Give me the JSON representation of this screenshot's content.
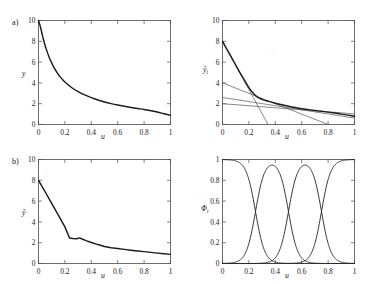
{
  "figure": {
    "background": "#ffffff",
    "line_color": "#1c1c1c",
    "thin_line_color": "#5a5a5a",
    "axis_color": "#4a4a4a"
  },
  "panels": {
    "a_label": "a)",
    "b_label": "b)"
  },
  "axes": {
    "x_label": "u",
    "x_ticks": [
      "0",
      "0.2",
      "0.4",
      "0.6",
      "0.8",
      "1"
    ],
    "x_tick_values": [
      0,
      0.2,
      0.4,
      0.6,
      0.8,
      1
    ],
    "y_label_a": "y",
    "y_label_a_right": "ŷ",
    "y_label_a_right_sub": "i",
    "y_label_b": "ŷ",
    "y_label_b_right": "Φ",
    "y_label_b_right_sub": "i",
    "y_ticks_value": [
      "0",
      "2",
      "4",
      "6",
      "8",
      "10"
    ],
    "y_tick_values_value": [
      0,
      2,
      4,
      6,
      8,
      10
    ],
    "y_ticks_unit": [
      "0",
      "0.2",
      "0.4",
      "0.6",
      "0.8",
      "1"
    ],
    "y_tick_values_unit": [
      0,
      0.2,
      0.4,
      0.6,
      0.8,
      1
    ]
  },
  "chart_data": [
    {
      "id": "panel-a-left",
      "type": "line",
      "title": "",
      "xlabel": "u",
      "ylabel": "y",
      "xlim": [
        0,
        1
      ],
      "ylim": [
        0,
        10
      ],
      "grid": false,
      "legend": "none",
      "series": [
        {
          "name": "true nonlinear system",
          "x": [
            0.0,
            0.01,
            0.02,
            0.03,
            0.04,
            0.05,
            0.06,
            0.08,
            0.1,
            0.12,
            0.15,
            0.18,
            0.2,
            0.25,
            0.3,
            0.35,
            0.4,
            0.45,
            0.5,
            0.55,
            0.6,
            0.65,
            0.7,
            0.75,
            0.8,
            0.85,
            0.9,
            0.95,
            1.0
          ],
          "y": [
            10.0,
            9.6,
            9.1,
            8.55,
            8.05,
            7.6,
            7.2,
            6.5,
            5.92,
            5.42,
            4.82,
            4.35,
            4.08,
            3.56,
            3.16,
            2.84,
            2.58,
            2.36,
            2.17,
            2.01,
            1.87,
            1.75,
            1.64,
            1.54,
            1.45,
            1.33,
            1.2,
            1.04,
            0.88
          ]
        }
      ]
    },
    {
      "id": "panel-a-right",
      "type": "line",
      "title": "",
      "xlabel": "u",
      "ylabel": "ŷᵢ",
      "xlim": [
        0,
        1
      ],
      "ylim": [
        0,
        10
      ],
      "grid": false,
      "legend": "none",
      "series": [
        {
          "name": "local model 1",
          "style": "thin",
          "x": [
            0,
            0.345
          ],
          "y": [
            8.0,
            0.0
          ]
        },
        {
          "name": "local model 2",
          "style": "thin",
          "x": [
            0,
            0.8
          ],
          "y": [
            4.0,
            0.0
          ]
        },
        {
          "name": "local model 3",
          "style": "thin",
          "x": [
            0,
            1.0
          ],
          "y": [
            2.6,
            0.62
          ]
        },
        {
          "name": "local model 4",
          "style": "thin",
          "x": [
            0,
            1.0
          ],
          "y": [
            2.0,
            1.02
          ]
        },
        {
          "name": "blended output",
          "style": "thick",
          "x": [
            0.0,
            0.05,
            0.1,
            0.15,
            0.2,
            0.25,
            0.3,
            0.35,
            0.4,
            0.45,
            0.5,
            0.55,
            0.6,
            0.65,
            0.7,
            0.75,
            0.8,
            0.85,
            0.9,
            0.95,
            1.0
          ],
          "y": [
            8.0,
            6.86,
            5.72,
            4.6,
            3.55,
            2.78,
            2.42,
            2.22,
            2.05,
            1.9,
            1.76,
            1.63,
            1.52,
            1.43,
            1.35,
            1.27,
            1.19,
            1.1,
            1.0,
            0.9,
            0.8
          ]
        }
      ]
    },
    {
      "id": "panel-b-left",
      "type": "line",
      "title": "",
      "xlabel": "u",
      "ylabel": "ŷ",
      "xlim": [
        0,
        1
      ],
      "ylim": [
        0,
        10
      ],
      "grid": false,
      "legend": "none",
      "series": [
        {
          "name": "piecewise linear approximation",
          "x": [
            0.0,
            0.05,
            0.1,
            0.15,
            0.2,
            0.235,
            0.26,
            0.29,
            0.31,
            0.33,
            0.36,
            0.4,
            0.45,
            0.5,
            0.55,
            0.6,
            0.65,
            0.7,
            0.75,
            0.8,
            0.85,
            0.9,
            0.95,
            1.0
          ],
          "y": [
            8.0,
            6.9,
            5.78,
            4.65,
            3.52,
            2.45,
            2.4,
            2.38,
            2.46,
            2.36,
            2.2,
            2.02,
            1.82,
            1.64,
            1.52,
            1.44,
            1.36,
            1.28,
            1.21,
            1.14,
            1.07,
            1.0,
            0.94,
            0.88
          ]
        }
      ]
    },
    {
      "id": "panel-b-right",
      "type": "line",
      "title": "",
      "xlabel": "u",
      "ylabel": "Φᵢ",
      "xlim": [
        0,
        1
      ],
      "ylim": [
        0,
        1
      ],
      "grid": false,
      "legend": "none",
      "crossover_points": [
        0.25,
        0.5,
        0.75
      ],
      "crossover_value": 0.5,
      "series": [
        {
          "name": "Φ₁",
          "center": 0.0,
          "type": "sigmoid-left",
          "edge": 0.25,
          "width": 0.035
        },
        {
          "name": "Φ₂",
          "center": 0.375,
          "type": "bell",
          "left_edge": 0.25,
          "right_edge": 0.5,
          "width": 0.035
        },
        {
          "name": "Φ₃",
          "center": 0.625,
          "type": "bell",
          "left_edge": 0.5,
          "right_edge": 0.75,
          "width": 0.035
        },
        {
          "name": "Φ₄",
          "center": 1.0,
          "type": "sigmoid-right",
          "edge": 0.75,
          "width": 0.035
        }
      ]
    }
  ]
}
